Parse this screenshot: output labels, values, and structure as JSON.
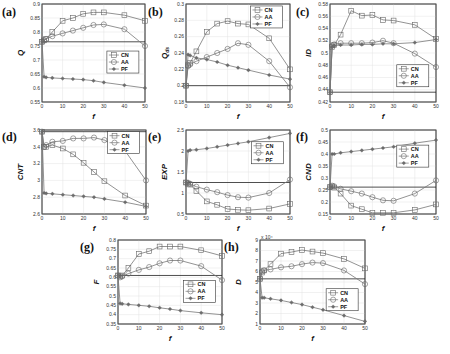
{
  "chart_data": [
    {
      "panel": "(a)",
      "type": "line",
      "ylabel": "Q",
      "xlabel": "f",
      "x": [
        0,
        1,
        2,
        5,
        10,
        15,
        20,
        25,
        30,
        40,
        50
      ],
      "xlim": [
        0,
        50
      ],
      "xticks": [
        0,
        10,
        20,
        30,
        40,
        50
      ],
      "ylim": [
        0.55,
        0.9
      ],
      "yticks": [
        "0.55",
        "0.6",
        "0.65",
        "0.7",
        "0.75",
        "0.8",
        "0.85",
        "0.9"
      ],
      "baseline": 0.765,
      "legend": [
        "CN",
        "AA",
        "PF"
      ],
      "legend_position": "right-middle",
      "series": [
        {
          "name": "CN",
          "marker": "square",
          "values": [
            0.765,
            0.77,
            0.775,
            0.8,
            0.84,
            0.85,
            0.865,
            0.87,
            0.87,
            0.86,
            0.84
          ]
        },
        {
          "name": "AA",
          "marker": "circle",
          "values": [
            0.765,
            0.77,
            0.775,
            0.785,
            0.795,
            0.805,
            0.815,
            0.825,
            0.827,
            0.81,
            0.75
          ]
        },
        {
          "name": "PF",
          "marker": "star",
          "values": [
            0.765,
            0.64,
            0.638,
            0.636,
            0.634,
            0.632,
            0.63,
            0.626,
            0.62,
            0.61,
            0.6
          ]
        }
      ]
    },
    {
      "panel": "(b)",
      "type": "line",
      "ylabel": "Q_ds",
      "xlabel": "f",
      "x": [
        0,
        1,
        2,
        5,
        10,
        15,
        20,
        25,
        30,
        40,
        50
      ],
      "xlim": [
        0,
        50
      ],
      "xticks": [
        0,
        10,
        20,
        30,
        40,
        50
      ],
      "ylim": [
        0.18,
        0.3
      ],
      "yticks": [
        "0.18",
        "0.2",
        "0.22",
        "0.24",
        "0.26",
        "0.28",
        "0.3"
      ],
      "baseline": 0.2,
      "legend": [
        "CN",
        "AA",
        "PF"
      ],
      "legend_position": "top-right",
      "series": [
        {
          "name": "CN",
          "marker": "square",
          "values": [
            0.2,
            0.225,
            0.228,
            0.242,
            0.266,
            0.276,
            0.279,
            0.276,
            0.275,
            0.258,
            0.22
          ]
        },
        {
          "name": "AA",
          "marker": "circle",
          "values": [
            0.2,
            0.224,
            0.226,
            0.23,
            0.235,
            0.24,
            0.245,
            0.252,
            0.25,
            0.23,
            0.198
          ]
        },
        {
          "name": "PF",
          "marker": "star",
          "values": [
            0.2,
            0.238,
            0.237,
            0.234,
            0.232,
            0.229,
            0.225,
            0.222,
            0.219,
            0.213,
            0.208
          ]
        }
      ]
    },
    {
      "panel": "(c)",
      "type": "line",
      "ylabel": "ID",
      "xlabel": "f",
      "x": [
        0,
        1,
        2,
        5,
        10,
        15,
        20,
        25,
        30,
        40,
        50
      ],
      "xlim": [
        0,
        50
      ],
      "xticks": [
        0,
        10,
        20,
        30,
        40,
        50
      ],
      "ylim": [
        0.42,
        0.58
      ],
      "yticks": [
        "0.42",
        "0.44",
        "0.46",
        "0.48",
        "0.5",
        "0.52",
        "0.54",
        "0.56",
        "0.58"
      ],
      "baseline": 0.436,
      "legend": [
        "CN",
        "AA",
        "PF"
      ],
      "legend_position": "bottom-right",
      "series": [
        {
          "name": "CN",
          "marker": "square",
          "values": [
            0.436,
            0.51,
            0.513,
            0.53,
            0.569,
            0.561,
            0.562,
            0.554,
            0.553,
            0.546,
            0.523
          ]
        },
        {
          "name": "AA",
          "marker": "circle",
          "values": [
            0.436,
            0.512,
            0.514,
            0.516,
            0.516,
            0.516,
            0.517,
            0.52,
            0.516,
            0.499,
            0.477
          ]
        },
        {
          "name": "PF",
          "marker": "star",
          "values": [
            0.436,
            0.51,
            0.512,
            0.513,
            0.513,
            0.514,
            0.514,
            0.515,
            0.515,
            0.517,
            0.522
          ]
        }
      ]
    },
    {
      "panel": "(d)",
      "type": "line",
      "ylabel": "CNT",
      "xlabel": "f",
      "x": [
        0,
        1,
        2,
        5,
        10,
        15,
        20,
        25,
        30,
        40,
        50
      ],
      "xlim": [
        0,
        50
      ],
      "xticks": [
        0,
        10,
        20,
        30,
        40,
        50
      ],
      "ylim": [
        2.6,
        3.6
      ],
      "yticks": [
        "2.6",
        "2.8",
        "3",
        "3.2",
        "3.4",
        "3.6"
      ],
      "baseline": 3.58,
      "legend": [
        "CN",
        "AA",
        "PF"
      ],
      "legend_position": "top-right",
      "series": [
        {
          "name": "CN",
          "marker": "square",
          "values": [
            3.58,
            3.4,
            3.4,
            3.42,
            3.38,
            3.31,
            3.21,
            3.1,
            2.99,
            2.82,
            2.7
          ]
        },
        {
          "name": "AA",
          "marker": "circle",
          "values": [
            3.58,
            3.4,
            3.42,
            3.46,
            3.47,
            3.5,
            3.5,
            3.51,
            3.48,
            3.35,
            3.0
          ]
        },
        {
          "name": "PF",
          "marker": "star",
          "values": [
            3.58,
            2.85,
            2.845,
            2.84,
            2.83,
            2.82,
            2.81,
            2.8,
            2.78,
            2.74,
            2.69
          ]
        }
      ]
    },
    {
      "panel": "(e)",
      "type": "line",
      "ylabel": "EXP",
      "xlabel": "f",
      "x": [
        0,
        1,
        2,
        5,
        10,
        15,
        20,
        25,
        30,
        40,
        50
      ],
      "xlim": [
        0,
        50
      ],
      "xticks": [
        0,
        10,
        20,
        30,
        40,
        50
      ],
      "ylim": [
        0.5,
        2.5
      ],
      "yticks": [
        "0.5",
        "1",
        "1.5",
        "2",
        "2.5"
      ],
      "baseline": 1.25,
      "legend": [
        "CN",
        "AA",
        "PF"
      ],
      "legend_position": "top-right",
      "series": [
        {
          "name": "CN",
          "marker": "square",
          "values": [
            1.25,
            1.22,
            1.2,
            1.05,
            0.8,
            0.72,
            0.62,
            0.6,
            0.59,
            0.63,
            0.74
          ]
        },
        {
          "name": "AA",
          "marker": "circle",
          "values": [
            1.25,
            1.24,
            1.22,
            1.15,
            1.08,
            1.02,
            0.95,
            0.9,
            0.89,
            1.0,
            1.32
          ]
        },
        {
          "name": "PF",
          "marker": "star",
          "values": [
            1.25,
            2.0,
            2.02,
            2.03,
            2.06,
            2.1,
            2.14,
            2.18,
            2.22,
            2.32,
            2.42
          ]
        }
      ]
    },
    {
      "panel": "(f)",
      "type": "line",
      "ylabel": "CND",
      "xlabel": "f",
      "x": [
        0,
        1,
        2,
        5,
        10,
        15,
        20,
        25,
        30,
        40,
        50
      ],
      "xlim": [
        0,
        50
      ],
      "xticks": [
        0,
        10,
        20,
        30,
        40,
        50
      ],
      "ylim": [
        0.15,
        0.5
      ],
      "yticks": [
        "0.15",
        "0.2",
        "0.25",
        "0.3",
        "0.35",
        "0.4",
        "0.45",
        "0.5"
      ],
      "baseline": 0.262,
      "legend": [
        "CN",
        "AA",
        "PF"
      ],
      "legend_position": "right-middle",
      "series": [
        {
          "name": "CN",
          "marker": "square",
          "values": [
            0.262,
            0.265,
            0.26,
            0.235,
            0.185,
            0.17,
            0.155,
            0.155,
            0.155,
            0.167,
            0.19
          ]
        },
        {
          "name": "AA",
          "marker": "circle",
          "values": [
            0.262,
            0.268,
            0.265,
            0.255,
            0.245,
            0.235,
            0.22,
            0.207,
            0.205,
            0.235,
            0.29
          ]
        },
        {
          "name": "PF",
          "marker": "star",
          "values": [
            0.262,
            0.4,
            0.4,
            0.405,
            0.41,
            0.415,
            0.42,
            0.425,
            0.43,
            0.445,
            0.458
          ]
        }
      ]
    },
    {
      "panel": "(g)",
      "type": "line",
      "ylabel": "F",
      "xlabel": "f",
      "x": [
        0,
        1,
        2,
        5,
        10,
        15,
        20,
        25,
        30,
        40,
        50
      ],
      "xlim": [
        0,
        50
      ],
      "xticks": [
        0,
        10,
        20,
        30,
        40,
        50
      ],
      "ylim": [
        0.35,
        0.8
      ],
      "yticks": [
        "0.35",
        "0.4",
        "0.45",
        "0.5",
        "0.55",
        "0.6",
        "0.65",
        "0.7",
        "0.75",
        "0.8"
      ],
      "baseline": 0.61,
      "legend": [
        "CN",
        "AA",
        "PF"
      ],
      "legend_position": "right-middle",
      "series": [
        {
          "name": "CN",
          "marker": "square",
          "values": [
            0.61,
            0.605,
            0.61,
            0.65,
            0.725,
            0.74,
            0.765,
            0.765,
            0.765,
            0.745,
            0.715
          ]
        },
        {
          "name": "AA",
          "marker": "circle",
          "values": [
            0.61,
            0.6,
            0.605,
            0.62,
            0.64,
            0.655,
            0.675,
            0.69,
            0.69,
            0.66,
            0.585
          ]
        },
        {
          "name": "PF",
          "marker": "star",
          "values": [
            0.61,
            0.46,
            0.458,
            0.455,
            0.45,
            0.445,
            0.437,
            0.43,
            0.422,
            0.41,
            0.4
          ]
        }
      ]
    },
    {
      "panel": "(h)",
      "type": "line",
      "ylabel": "D",
      "xlabel": "f",
      "y_multiplier": "x 10^4",
      "x": [
        0,
        1,
        2,
        5,
        10,
        15,
        20,
        25,
        30,
        40,
        50
      ],
      "xlim": [
        0,
        50
      ],
      "xticks": [
        0,
        10,
        20,
        30,
        40,
        50
      ],
      "ylim": [
        1,
        9
      ],
      "yticks": [
        "1",
        "2",
        "3",
        "4",
        "5",
        "6",
        "7",
        "8",
        "9"
      ],
      "baseline": 5.3,
      "legend": [
        "CN",
        "AA",
        "PF"
      ],
      "legend_position": "bottom-right",
      "series": [
        {
          "name": "CN",
          "marker": "square",
          "values": [
            5.3,
            5.9,
            6.1,
            6.7,
            7.7,
            7.85,
            8.05,
            7.9,
            7.75,
            7.2,
            6.3
          ]
        },
        {
          "name": "AA",
          "marker": "circle",
          "values": [
            5.3,
            6.0,
            6.1,
            6.2,
            6.4,
            6.5,
            6.7,
            6.85,
            6.8,
            6.1,
            4.8
          ]
        },
        {
          "name": "PF",
          "marker": "star",
          "values": [
            5.3,
            3.5,
            3.5,
            3.4,
            3.25,
            3.05,
            2.85,
            2.6,
            2.35,
            1.8,
            1.25
          ]
        }
      ]
    }
  ],
  "labels": {
    "panels": [
      "(a)",
      "(b)",
      "(c)",
      "(d)",
      "(e)",
      "(f)",
      "(g)",
      "(h)"
    ],
    "xlabel": "f",
    "h_multiplier": "x 10⁴"
  }
}
